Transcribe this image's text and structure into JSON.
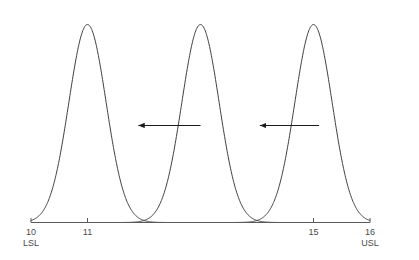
{
  "chart_data": {
    "type": "line",
    "title": "",
    "subtitle": "",
    "xlabel": "",
    "ylabel": "",
    "xlim": [
      10,
      16
    ],
    "ylim": [
      0,
      1
    ],
    "grid": false,
    "legend": "none",
    "axis": {
      "line_color": "#595959",
      "tick_color": "#595959",
      "baseline_only": true,
      "ticks": [
        {
          "value": 10,
          "label": "10",
          "spec_label": "LSL"
        },
        {
          "value": 11,
          "label": "11",
          "spec_label": ""
        },
        {
          "value": 15,
          "label": "15",
          "spec_label": ""
        },
        {
          "value": 16,
          "label": "16",
          "spec_label": "USL"
        }
      ]
    },
    "spec_limits": {
      "lower": {
        "value": 10,
        "label": "LSL"
      },
      "upper": {
        "value": 16,
        "label": "USL"
      }
    },
    "curve_color": "#404040",
    "curve_width": 1,
    "series": [
      {
        "name": "distribution-1",
        "type": "gaussian",
        "mean": 11.0,
        "sigma": 0.33,
        "peak_height": 1.0
      },
      {
        "name": "distribution-2",
        "type": "gaussian",
        "mean": 13.0,
        "sigma": 0.33,
        "peak_height": 1.0
      },
      {
        "name": "distribution-3",
        "type": "gaussian",
        "mean": 15.0,
        "sigma": 0.33,
        "peak_height": 1.0
      }
    ],
    "annotations": [
      {
        "name": "shift-arrow-1",
        "type": "arrow",
        "direction": "left",
        "x_start": 13.0,
        "x_end": 11.9,
        "y": 0.49,
        "color": "#1a1a1a",
        "text": ""
      },
      {
        "name": "shift-arrow-2",
        "type": "arrow",
        "direction": "left",
        "x_start": 15.1,
        "x_end": 14.05,
        "y": 0.49,
        "color": "#1a1a1a",
        "text": ""
      }
    ]
  },
  "figure": {
    "background": "#ffffff"
  }
}
